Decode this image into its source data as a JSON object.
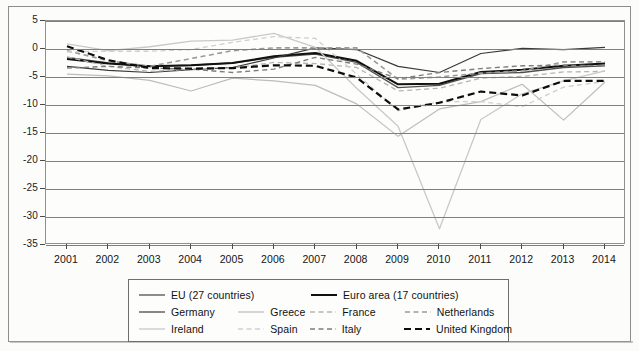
{
  "chart_data": {
    "type": "line",
    "title": "",
    "subtitle": "",
    "xlabel": "",
    "ylabel": "",
    "grid": true,
    "legend_position": "bottom",
    "x": [
      2001,
      2002,
      2003,
      2004,
      2005,
      2006,
      2007,
      2008,
      2009,
      2010,
      2011,
      2012,
      2013,
      2014
    ],
    "xtick_labels": [
      "2001",
      "2002",
      "2003",
      "2004",
      "2005",
      "2006",
      "2007",
      "2008",
      "2009",
      "2010",
      "2011",
      "2012",
      "2013",
      "2014"
    ],
    "ytick_labels": [
      "5",
      "0",
      "-5",
      "-10",
      "-15",
      "-20",
      "-25",
      "-30",
      "-35"
    ],
    "ytick_values": [
      5,
      0,
      -5,
      -10,
      -15,
      -20,
      -25,
      -30,
      -35
    ],
    "ylim": [
      -35,
      5
    ],
    "xlim": [
      2001,
      2014
    ],
    "series": [
      {
        "name": "EU (27 countries)",
        "color": "#4f4f4f",
        "style": "solid",
        "width": 1.3,
        "values": [
          -1.5,
          -2.5,
          -3.1,
          -2.9,
          -2.5,
          -1.5,
          -0.9,
          -2.4,
          -6.9,
          -6.5,
          -4.4,
          -4.2,
          -3.3,
          -3.0
        ]
      },
      {
        "name": "Euro area (17 countries)",
        "color": "#101010",
        "style": "solid",
        "width": 2.0,
        "values": [
          -1.8,
          -2.6,
          -3.1,
          -2.9,
          -2.5,
          -1.3,
          -0.7,
          -2.1,
          -6.3,
          -6.2,
          -4.1,
          -3.7,
          -3.0,
          -2.6
        ]
      },
      {
        "name": "Germany",
        "color": "#3a3a3a",
        "style": "solid",
        "width": 1.2,
        "values": [
          -3.1,
          -3.8,
          -4.2,
          -3.7,
          -3.3,
          -1.6,
          0.2,
          -0.1,
          -3.1,
          -4.2,
          -0.8,
          0.1,
          -0.1,
          0.3
        ]
      },
      {
        "name": "Greece",
        "color": "#bdbdbd",
        "style": "solid",
        "width": 1.2,
        "values": [
          -4.5,
          -4.8,
          -5.6,
          -7.5,
          -5.2,
          -5.7,
          -6.5,
          -9.8,
          -15.6,
          -10.7,
          -9.4,
          -6.3,
          -12.7,
          -5.9
        ]
      },
      {
        "name": "France",
        "color": "#b5b5b5",
        "style": "dashed",
        "width": 1.3,
        "values": [
          -1.4,
          -3.1,
          -4.0,
          -3.6,
          -3.4,
          -2.4,
          -2.6,
          -3.3,
          -7.5,
          -7.0,
          -5.2,
          -4.9,
          -4.1,
          -4.0
        ]
      },
      {
        "name": "Netherlands",
        "color": "#9a9a9a",
        "style": "dashed",
        "width": 1.6,
        "values": [
          -0.3,
          -2.1,
          -3.1,
          -1.7,
          -0.3,
          0.2,
          0.2,
          0.2,
          -5.4,
          -5.0,
          -4.3,
          -3.9,
          -2.3,
          -2.3
        ]
      },
      {
        "name": "Ireland",
        "color": "#c9c9c9",
        "style": "solid",
        "width": 1.3,
        "values": [
          0.9,
          -0.3,
          0.4,
          1.4,
          1.6,
          2.8,
          0.3,
          -7.0,
          -13.8,
          -32.1,
          -12.6,
          -8.0,
          -5.7,
          -3.9
        ]
      },
      {
        "name": "Spain",
        "color": "#cfcfcf",
        "style": "dashed",
        "width": 1.3,
        "values": [
          -0.5,
          -0.4,
          -0.4,
          -0.1,
          1.2,
          2.2,
          1.9,
          -4.5,
          -11.0,
          -9.4,
          -9.4,
          -10.3,
          -6.8,
          -5.8
        ]
      },
      {
        "name": "Italy",
        "color": "#7d7d7d",
        "style": "dashed",
        "width": 1.4,
        "values": [
          -3.4,
          -3.1,
          -3.4,
          -3.6,
          -4.2,
          -3.6,
          -1.5,
          -2.7,
          -5.3,
          -4.2,
          -3.5,
          -3.0,
          -2.9,
          -3.0
        ]
      },
      {
        "name": "United Kingdom",
        "color": "#0d0d0d",
        "style": "dashed",
        "width": 2.2,
        "values": [
          0.5,
          -2.0,
          -3.4,
          -3.5,
          -3.4,
          -2.9,
          -3.0,
          -5.1,
          -10.8,
          -9.6,
          -7.6,
          -8.3,
          -5.7,
          -5.7
        ]
      }
    ]
  },
  "legend": {
    "rows": [
      [
        {
          "label": "EU (27 countries)",
          "series": 0
        },
        {
          "label": "Euro area (17 countries)",
          "series": 1
        }
      ],
      [
        {
          "label": "Germany",
          "series": 2
        },
        {
          "label": "Greece",
          "series": 3
        },
        {
          "label": "France",
          "series": 4
        },
        {
          "label": "Netherlands",
          "series": 5
        }
      ],
      [
        {
          "label": "Ireland",
          "series": 6
        },
        {
          "label": "Spain",
          "series": 7
        },
        {
          "label": "Italy",
          "series": 8
        },
        {
          "label": "United Kingdom",
          "series": 9
        }
      ]
    ]
  },
  "colors": {
    "background": "#fcfcfb",
    "frame": "#8d8d8d",
    "gridline": "#7f7f7f",
    "axis_text": "#141414"
  }
}
